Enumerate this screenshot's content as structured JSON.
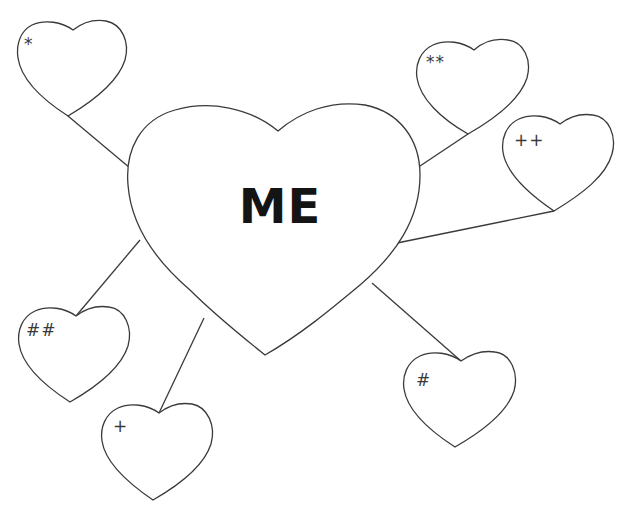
{
  "diagram": {
    "type": "heart-map",
    "center": {
      "label": "ME"
    },
    "satellites": [
      {
        "id": "star",
        "label": "*"
      },
      {
        "id": "double-star",
        "label": "**"
      },
      {
        "id": "double-plus",
        "label": "++"
      },
      {
        "id": "double-hash",
        "label": "##"
      },
      {
        "id": "plus",
        "label": "+"
      },
      {
        "id": "hash",
        "label": "#"
      }
    ],
    "colors": {
      "stroke": "#3a3a3a",
      "text": "#141414",
      "background": "#ffffff"
    }
  }
}
